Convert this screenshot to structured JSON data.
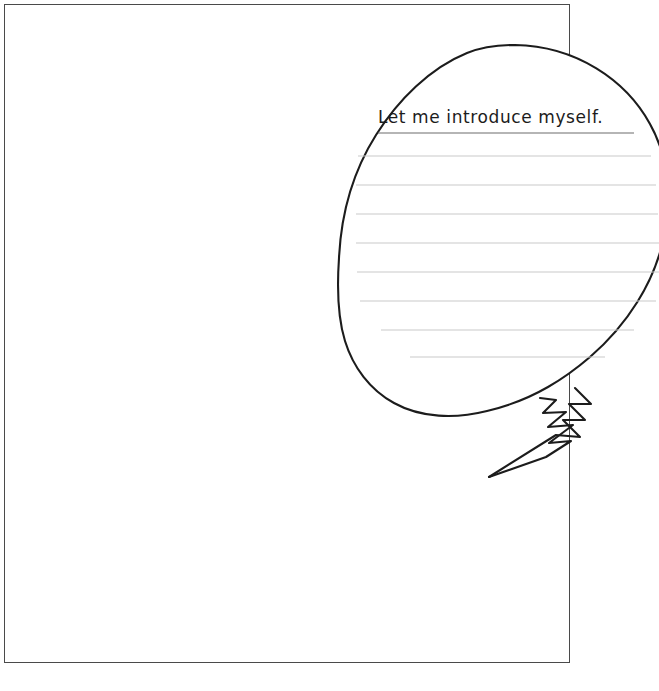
{
  "document": {
    "type": "worksheet",
    "orientation": "portrait",
    "background_color": "#ffffff",
    "page_border_color": "#4a4a4a"
  },
  "speech_bubble": {
    "heading": "Let me introduce myself.",
    "heading_underlined": true,
    "outline_color": "#1c1c1c",
    "fill_color": "#ffffff",
    "tail_style": "jagged-zigzag",
    "tail_direction": "down-left",
    "ruled_line_color": "#c9c9c9",
    "ruled_line_count": 8,
    "ruled_lines": [
      {
        "y": 156,
        "x1": 358,
        "x2": 651
      },
      {
        "y": 185,
        "x1": 356,
        "x2": 656
      },
      {
        "y": 214,
        "x1": 356,
        "x2": 658
      },
      {
        "y": 243,
        "x1": 356,
        "x2": 659
      },
      {
        "y": 272,
        "x1": 357,
        "x2": 659
      },
      {
        "y": 301,
        "x1": 360,
        "x2": 656
      },
      {
        "y": 330,
        "x1": 381,
        "x2": 634
      },
      {
        "y": 357,
        "x1": 410,
        "x2": 605
      }
    ]
  },
  "footer": {
    "credit": ""
  }
}
